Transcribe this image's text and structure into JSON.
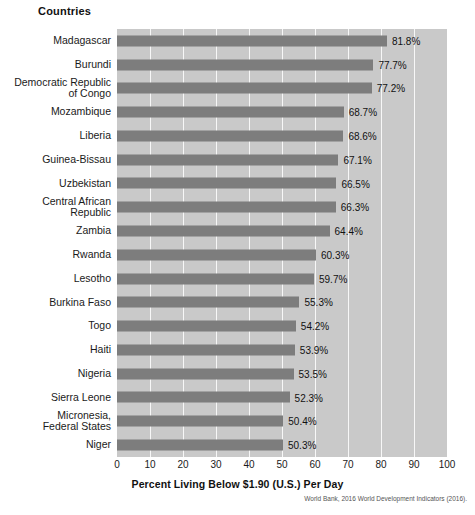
{
  "header": {
    "countries_label": "Countries"
  },
  "chart_data": {
    "type": "bar",
    "orientation": "horizontal",
    "title": "",
    "xlabel": "Percent Living Below $1.90 (U.S.) Per Day",
    "ylabel": "Countries",
    "xlim": [
      0,
      100
    ],
    "xticks": [
      0,
      10,
      20,
      30,
      40,
      50,
      60,
      70,
      80,
      90,
      100
    ],
    "xtick_labels": [
      "0",
      "10",
      "20",
      "30",
      "40",
      "50",
      "60",
      "70",
      "80",
      "90",
      "100"
    ],
    "grid": "vertical-white-gridlines",
    "legend": "none",
    "categories": [
      "Madagascar",
      "Burundi",
      "Democratic Republic of Congo",
      "Mozambique",
      "Liberia",
      "Guinea-Bissau",
      "Uzbekistan",
      "Central African Republic",
      "Zambia",
      "Rwanda",
      "Lesotho",
      "Burkina Faso",
      "Togo",
      "Haiti",
      "Nigeria",
      "Sierra Leone",
      "Micronesia, Federal States",
      "Niger"
    ],
    "category_lines": [
      [
        "Madagascar"
      ],
      [
        "Burundi"
      ],
      [
        "Democratic Republic",
        "of Congo"
      ],
      [
        "Mozambique"
      ],
      [
        "Liberia"
      ],
      [
        "Guinea-Bissau"
      ],
      [
        "Uzbekistan"
      ],
      [
        "Central African",
        "Republic"
      ],
      [
        "Zambia"
      ],
      [
        "Rwanda"
      ],
      [
        "Lesotho"
      ],
      [
        "Burkina Faso"
      ],
      [
        "Togo"
      ],
      [
        "Haiti"
      ],
      [
        "Nigeria"
      ],
      [
        "Sierra Leone"
      ],
      [
        "Micronesia,",
        "Federal States"
      ],
      [
        "Niger"
      ]
    ],
    "values": [
      81.8,
      77.7,
      77.2,
      68.7,
      68.6,
      67.1,
      66.5,
      66.3,
      64.4,
      60.3,
      59.7,
      55.3,
      54.2,
      53.9,
      53.5,
      52.3,
      50.4,
      50.3
    ],
    "value_labels": [
      "81.8%",
      "77.7%",
      "77.2%",
      "68.7%",
      "68.6%",
      "67.1%",
      "66.5%",
      "66.3%",
      "64.4%",
      "60.3%",
      "59.7%",
      "55.3%",
      "54.2%",
      "53.9%",
      "53.5%",
      "52.3%",
      "50.4%",
      "50.3%"
    ],
    "colors": {
      "bar": "#7d7d7d",
      "plot_background": "#c9c9c9",
      "gridline": "#ffffff",
      "text": "#1a1a1a",
      "page_background": "#ffffff"
    }
  },
  "source": {
    "text": "World Bank, 2016 World Development Indicators (2016)."
  }
}
